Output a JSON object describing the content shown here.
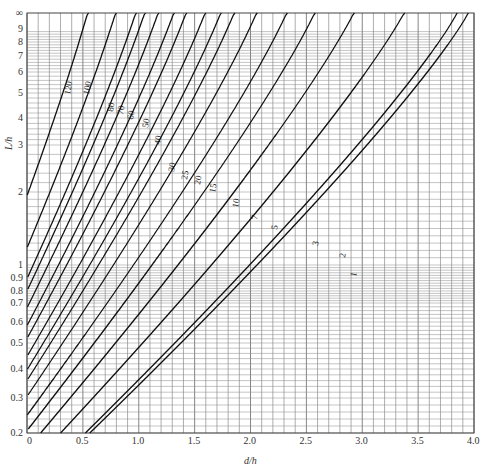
{
  "chart_data": {
    "type": "line",
    "title": "",
    "xlabel": "d/h",
    "ylabel": "L/h",
    "xlim": [
      0,
      4.0
    ],
    "ylim": [
      0.2,
      "∞"
    ],
    "grid": true,
    "legend": "none (curves labeled inline)",
    "x_ticks": [
      "0",
      "0.5",
      "1.0",
      "1.5",
      "2.0",
      "2.5",
      "3.0",
      "3.5",
      "4.0"
    ],
    "y_ticks": [
      "0.2",
      "0.3",
      "0.4",
      "0.5",
      "0.6",
      "0.7",
      "0.8",
      "0.9",
      "1",
      "2",
      "3",
      "4",
      "5",
      "6",
      "7",
      "8",
      "9",
      "∞"
    ],
    "series": [
      {
        "name": "120",
        "x_at_top": 0.55,
        "y_at_left": 1.1
      },
      {
        "name": "100",
        "x_at_top": 0.8,
        "y_at_left": 0.72
      },
      {
        "name": "80",
        "x_at_top": 0.98,
        "y_at_left": 0.52
      },
      {
        "name": "70",
        "x_at_top": 1.06,
        "y_at_left": 0.44
      },
      {
        "name": "60",
        "x_at_top": 1.18,
        "y_at_left": 0.36
      },
      {
        "name": "50",
        "x_at_top": 1.32,
        "y_at_left": 0.3
      },
      {
        "name": "40",
        "x_at_top": 1.43,
        "y_at_left": 0.25
      },
      {
        "name": "30",
        "x_at_top": 1.6,
        "y_at_left": 0.21
      },
      {
        "name": "25",
        "x_at_top": 1.74,
        "y_at_left": null
      },
      {
        "name": "20",
        "x_at_top": 1.86,
        "y_at_left": null
      },
      {
        "name": "15",
        "x_at_top": 2.06,
        "y_at_left": null
      },
      {
        "name": "10",
        "x_at_top": 2.33,
        "y_at_left": null
      },
      {
        "name": "7",
        "x_at_top": 2.58,
        "y_at_left": null
      },
      {
        "name": "5",
        "x_at_top": 2.93,
        "y_at_left": null
      },
      {
        "name": "3",
        "x_at_top": 3.38,
        "y_at_left": null
      },
      {
        "name": "2",
        "x_at_top": 3.85,
        "y_at_left": null
      },
      {
        "name": "1",
        "x_at_top": 3.95,
        "y_at_left": null
      }
    ]
  },
  "axes": {
    "x_label": "d/h",
    "y_label": "L/h"
  }
}
